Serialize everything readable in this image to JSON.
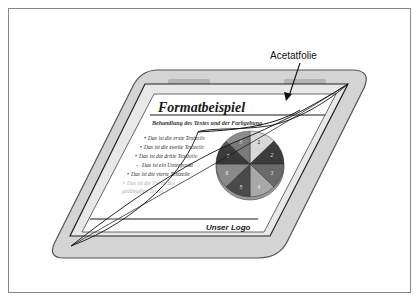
{
  "figure": {
    "label": "Acetatfolie",
    "slide": {
      "title": "Formatbeispiel",
      "subtitle": "Behandlung des Textes und der Farbgebung",
      "bullets": [
        {
          "marker": "•",
          "text": "Das ist die erste Textzeile"
        },
        {
          "marker": "•",
          "text": "Das ist die zweite Textzeile"
        },
        {
          "marker": "•",
          "text": "Das ist die dritte Textzeile"
        },
        {
          "marker": "-",
          "text": "Das ist ein Unterpunkt"
        },
        {
          "marker": "•",
          "text": "Das ist die vierte Textzeile"
        },
        {
          "marker": "•",
          "text": "Das ist die Farbe des"
        },
        {
          "marker": "",
          "text": "gedämpften Textes"
        }
      ],
      "pie_labels": [
        "1",
        "2",
        "3",
        "4",
        "5",
        "6",
        "7",
        "8"
      ],
      "footer_logo": "Unser Logo"
    },
    "colors": {
      "frame_fill": "#d4d4d4",
      "frame_stroke": "#555555",
      "slide_fill": "#ffffff",
      "ink": "#1a1a1a",
      "muted_text": "#b0b0b0",
      "border": "#888888",
      "pie": [
        "#d8d8d8",
        "#3c3c3c",
        "#6a6a6a",
        "#a8a8a8",
        "#4a4a4a",
        "#8a8a8a",
        "#3a3a3a",
        "#7a7a7a"
      ]
    }
  }
}
